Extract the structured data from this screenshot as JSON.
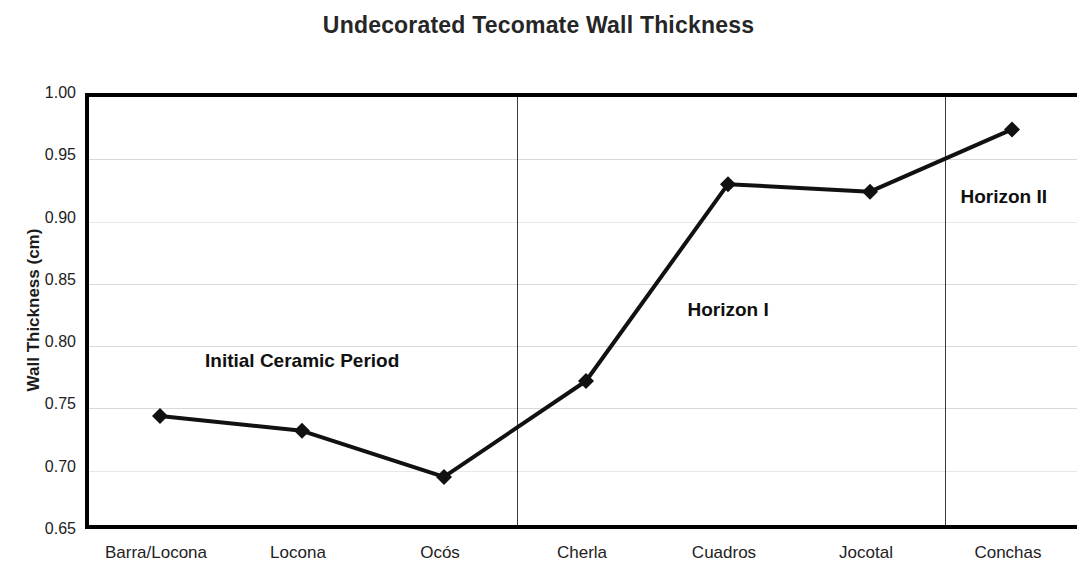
{
  "chart_data": {
    "type": "line",
    "title": "Undecorated Tecomate Wall Thickness",
    "xlabel": "",
    "ylabel": "Wall Thickness (cm)",
    "categories": [
      "Barra/Locona",
      "Locona",
      "Ocós",
      "Cherla",
      "Cuadros",
      "Jocotal",
      "Conchas"
    ],
    "values": [
      0.744,
      0.732,
      0.695,
      0.772,
      0.93,
      0.924,
      0.974
    ],
    "series": [
      {
        "name": "Wall Thickness",
        "values": [
          0.744,
          0.732,
          0.695,
          0.772,
          0.93,
          0.924,
          0.974
        ]
      }
    ],
    "ylim": [
      0.65,
      1.0
    ],
    "ytick_labels": [
      "1.00",
      "0.95",
      "0.90",
      "0.85",
      "0.80",
      "0.75",
      "0.70",
      "0.65"
    ],
    "ytick_values": [
      1.0,
      0.95,
      0.9,
      0.85,
      0.8,
      0.75,
      0.7,
      0.65
    ],
    "grid": true,
    "legend": "none",
    "marker": "diamond",
    "line_color": "#111111",
    "marker_color": "#111111",
    "annotations": [
      {
        "text": "Initial Ceramic Period",
        "x_category": "Locona",
        "y_value": 0.787
      },
      {
        "text": "Horizon I",
        "x_category": "Cuadros",
        "y_value": 0.828
      },
      {
        "text": "Horizon II",
        "x_category": "Conchas",
        "y_value": 0.919
      }
    ],
    "dividers": [
      {
        "after_category": "Ocós",
        "x_px": 513
      },
      {
        "after_category": "Jocotal",
        "x_px": 941
      }
    ]
  }
}
